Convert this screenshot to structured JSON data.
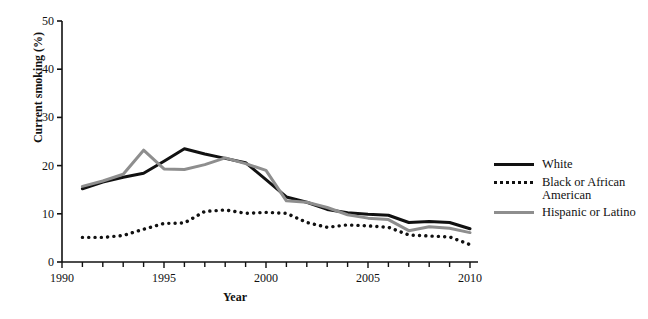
{
  "chart_data": {
    "type": "line",
    "title": "",
    "xlabel": "Year",
    "ylabel": "Current smoking (%)",
    "xlim": [
      1990,
      2010
    ],
    "ylim": [
      0,
      50
    ],
    "ytick_labels": [
      "0",
      "10",
      "20",
      "30",
      "40",
      "50"
    ],
    "yticks": [
      0,
      10,
      20,
      30,
      40,
      50
    ],
    "xtick_labels": [
      "1990",
      "1995",
      "2000",
      "2005",
      "2010"
    ],
    "xticks": [
      1990,
      1995,
      2000,
      2005,
      2010
    ],
    "xtick_minor_step": 1,
    "grid": false,
    "legend_position": "right",
    "x": [
      1991,
      1992,
      1993,
      1994,
      1995,
      1996,
      1997,
      1998,
      1999,
      2000,
      2001,
      2002,
      2003,
      2004,
      2005,
      2006,
      2007,
      2008,
      2009,
      2010
    ],
    "series": [
      {
        "name": "White",
        "style": "solid",
        "color": "#111111",
        "values": [
          15.2,
          16.6,
          17.6,
          18.4,
          20.9,
          23.5,
          22.4,
          21.5,
          20.6,
          17.1,
          13.5,
          12.4,
          10.9,
          10.2,
          9.9,
          9.7,
          8.2,
          8.4,
          8.2,
          6.9
        ]
      },
      {
        "name": "Black or African\nAmerican",
        "style": "dotted",
        "color": "#111111",
        "values": [
          5.1,
          5.1,
          5.5,
          6.8,
          8.0,
          8.1,
          10.5,
          10.8,
          10.1,
          10.3,
          10.1,
          8.2,
          7.2,
          7.7,
          7.5,
          7.2,
          5.6,
          5.4,
          5.2,
          3.6
        ]
      },
      {
        "name": "Hispanic or Latino",
        "style": "solid",
        "color": "#8e8e8e",
        "values": [
          15.7,
          16.8,
          18.2,
          23.2,
          19.3,
          19.2,
          20.2,
          21.6,
          20.4,
          19.0,
          12.7,
          12.4,
          11.3,
          9.8,
          9.1,
          8.8,
          6.5,
          7.3,
          7.0,
          6.1
        ]
      }
    ]
  },
  "axes": {
    "ylabel": "Current smoking (%)",
    "xlabel": "Year"
  },
  "legend": {
    "items": [
      {
        "label": "White",
        "icon": "solid-dark-line-icon"
      },
      {
        "label": "Black or African\nAmerican",
        "icon": "dotted-dark-line-icon"
      },
      {
        "label": "Hispanic or Latino",
        "icon": "solid-gray-line-icon"
      }
    ]
  },
  "colors": {
    "white_series": "#111111",
    "black_series": "#111111",
    "hispanic_series": "#8e8e8e",
    "axis": "#111111",
    "background": "#ffffff"
  }
}
